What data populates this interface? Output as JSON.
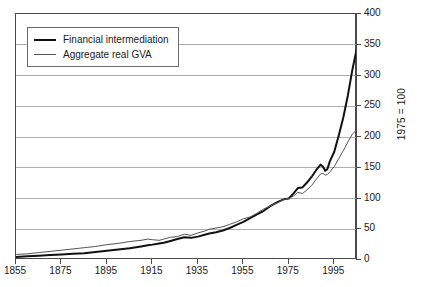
{
  "chart_data": {
    "type": "line",
    "title": "",
    "xlabel": "",
    "ylabel": "1975 = 100",
    "xlim": [
      1855,
      2005
    ],
    "ylim": [
      0,
      400
    ],
    "grid": true,
    "legend_position": "top-left",
    "x_ticks": [
      1855,
      1875,
      1895,
      1915,
      1935,
      1955,
      1975,
      1995
    ],
    "x_tick_labels": [
      "1855",
      "1875",
      "1895",
      "1915",
      "1935",
      "1955",
      "1975",
      "1995"
    ],
    "y_ticks": [
      0,
      50,
      100,
      150,
      200,
      250,
      300,
      350,
      400
    ],
    "y_tick_labels": [
      "0",
      "50",
      "100",
      "150",
      "200",
      "250",
      "300",
      "350",
      "400"
    ],
    "series": [
      {
        "name": "Financial intermediation",
        "color": "#111111",
        "width": 2,
        "x": [
          1855,
          1860,
          1865,
          1870,
          1875,
          1880,
          1885,
          1890,
          1895,
          1900,
          1905,
          1910,
          1913,
          1915,
          1918,
          1920,
          1923,
          1926,
          1929,
          1932,
          1935,
          1938,
          1940,
          1943,
          1946,
          1949,
          1952,
          1955,
          1958,
          1961,
          1964,
          1967,
          1970,
          1973,
          1975,
          1977,
          1979,
          1981,
          1983,
          1985,
          1987,
          1989,
          1990,
          1991,
          1992,
          1993,
          1995,
          1997,
          1999,
          2001,
          2003,
          2005
        ],
        "values": [
          5,
          6,
          7,
          8,
          9,
          10,
          11,
          13,
          15,
          17,
          19,
          22,
          24,
          25,
          27,
          28,
          31,
          34,
          37,
          36,
          38,
          41,
          43,
          45,
          48,
          52,
          57,
          62,
          68,
          74,
          80,
          88,
          94,
          99,
          100,
          108,
          117,
          118,
          126,
          135,
          146,
          155,
          152,
          145,
          148,
          160,
          176,
          203,
          232,
          268,
          310,
          345
        ]
      },
      {
        "name": "Aggregate real GVA",
        "color": "#555555",
        "width": 1,
        "x": [
          1855,
          1860,
          1865,
          1870,
          1875,
          1880,
          1885,
          1890,
          1895,
          1900,
          1905,
          1910,
          1913,
          1915,
          1918,
          1920,
          1923,
          1926,
          1929,
          1932,
          1935,
          1938,
          1940,
          1943,
          1946,
          1949,
          1952,
          1955,
          1958,
          1961,
          1964,
          1967,
          1970,
          1973,
          1975,
          1977,
          1979,
          1981,
          1983,
          1985,
          1987,
          1989,
          1990,
          1991,
          1992,
          1993,
          1995,
          1997,
          1999,
          2001,
          2003,
          2005
        ],
        "values": [
          9,
          10,
          12,
          14,
          16,
          18,
          20,
          22,
          25,
          27,
          30,
          32,
          34,
          33,
          32,
          34,
          37,
          38,
          42,
          40,
          44,
          47,
          50,
          52,
          54,
          58,
          62,
          67,
          70,
          76,
          83,
          88,
          93,
          99,
          100,
          104,
          110,
          108,
          114,
          121,
          131,
          140,
          141,
          138,
          139,
          143,
          152,
          165,
          178,
          192,
          205,
          212
        ]
      }
    ]
  },
  "legend": {
    "items": [
      {
        "label": "Financial intermediation",
        "style": "thick"
      },
      {
        "label": "Aggregate real GVA",
        "style": "thin"
      }
    ]
  },
  "axes": {
    "y_title": "1975 = 100"
  }
}
